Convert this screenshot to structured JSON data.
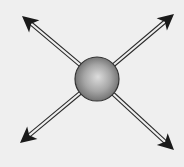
{
  "diagram": {
    "background": "#efefef",
    "center": {
      "x": 97,
      "y": 79,
      "r": 22
    },
    "sphere_colors": {
      "highlight": "#d8d8d8",
      "mid": "#a8a8a8",
      "edge": "#6a6a6a",
      "outline": "#333333"
    },
    "arrow_color": "#1a1a1a",
    "arrows": [
      {
        "name": "arrow-up-left",
        "tip": [
          22,
          16
        ]
      },
      {
        "name": "arrow-up-right",
        "tip": [
          174,
          14
        ]
      },
      {
        "name": "arrow-down-left",
        "tip": [
          20,
          143
        ]
      },
      {
        "name": "arrow-down-right",
        "tip": [
          174,
          150
        ]
      }
    ]
  }
}
